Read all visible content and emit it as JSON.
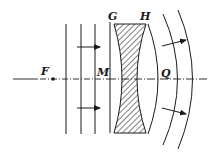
{
  "diagram": {
    "labels": {
      "F": "F",
      "M": "M",
      "G": "G",
      "H": "H",
      "Q": "Q"
    },
    "colors": {
      "ink": "#1a1a1a",
      "background": "#ffffff"
    },
    "elements": {
      "optical_axis": "dash-dot horizontal axis",
      "focal_point": "F (dot on axis)",
      "incident_wavefronts": 3,
      "incident_rays": 2,
      "lens": "hatched concave lens between G and H",
      "emergent_wavefronts": 3,
      "emergent_rays": 2
    }
  }
}
